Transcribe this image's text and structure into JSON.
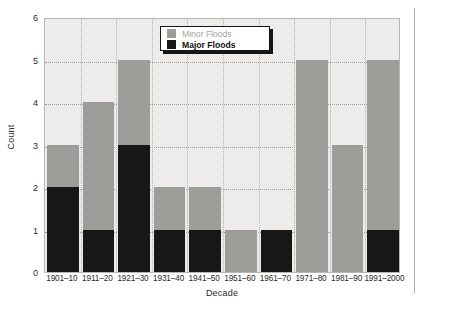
{
  "chart_data": {
    "type": "bar",
    "title": "",
    "subtitle": "",
    "xlabel": "Decade",
    "ylabel": "Count",
    "categories": [
      "1901–10",
      "1911–20",
      "1921–30",
      "1931–40",
      "1941–50",
      "1951–60",
      "1961–70",
      "1971–80",
      "1981–90",
      "1991–2000"
    ],
    "series": [
      {
        "name": "Major Floods",
        "color": "#171717",
        "values": [
          2,
          1,
          3,
          1,
          1,
          0,
          1,
          0,
          0,
          1
        ]
      },
      {
        "name": "Minor Floods",
        "color": "#9d9d9a",
        "values": [
          1,
          3,
          2,
          1,
          1,
          1,
          0,
          5,
          3,
          4
        ]
      }
    ],
    "stacked": true,
    "totals": [
      3,
      4,
      5,
      2,
      2,
      1,
      1,
      5,
      3,
      5
    ],
    "ylim": [
      0,
      6
    ],
    "yticks": [
      0,
      1,
      2,
      3,
      4,
      5,
      6
    ],
    "ytick_labels": [
      "0",
      "1",
      "2",
      "3",
      "4",
      "5",
      "6"
    ],
    "grid": true,
    "grid_style": "dotted",
    "legend_position": "top-center",
    "plot_background": "#edecea"
  },
  "legend": {
    "items": [
      {
        "label": "Minor Floods",
        "swatch": "minor"
      },
      {
        "label": "Major Floods",
        "swatch": "major"
      }
    ]
  }
}
